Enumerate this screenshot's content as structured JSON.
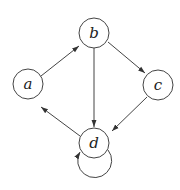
{
  "diagram": {
    "type": "directed-graph",
    "nodes": [
      {
        "id": "a",
        "label": "a",
        "cx": 28,
        "cy": 84,
        "r": 15
      },
      {
        "id": "b",
        "label": "b",
        "cx": 94,
        "cy": 33,
        "r": 15
      },
      {
        "id": "c",
        "label": "c",
        "cx": 158,
        "cy": 85,
        "r": 15
      },
      {
        "id": "d",
        "label": "d",
        "cx": 94,
        "cy": 143,
        "r": 15
      }
    ],
    "edges": [
      {
        "from": "a",
        "to": "b"
      },
      {
        "from": "b",
        "to": "c"
      },
      {
        "from": "b",
        "to": "d"
      },
      {
        "from": "c",
        "to": "d"
      },
      {
        "from": "d",
        "to": "a"
      },
      {
        "from": "d",
        "to": "d",
        "self_loop": true
      }
    ],
    "colors": {
      "stroke": "#444444",
      "background": "#ffffff",
      "text": "#222222"
    }
  }
}
